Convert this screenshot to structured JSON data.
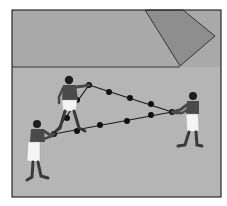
{
  "illustration": {
    "description": "Three figures stretching a knotted rope into a right triangle; pyramid face in background",
    "colors": {
      "sky": "#a9a9a9",
      "ground": "#b4b4b4",
      "pyramid": "#8e8e8e",
      "frame": "#2a2a2a",
      "rope": "#1a1a1a",
      "knot": "#111111",
      "skin": "#4a4a4a",
      "kilt": "#f4f4f4",
      "hair": "#1e1e1e"
    },
    "frame": {
      "x": 12,
      "y": 10,
      "width": 209,
      "height": 187
    },
    "horizon_y": 67,
    "pyramid_points": "145,10 183,10 215,36 180,66",
    "rope_triangle": {
      "corners": [
        [
          89,
          85
        ],
        [
          172,
          112
        ],
        [
          54,
          134
        ]
      ],
      "knots": [
        [
          89,
          85
        ],
        [
          109,
          92
        ],
        [
          130,
          98
        ],
        [
          151,
          104
        ],
        [
          172,
          112
        ],
        [
          151,
          115
        ],
        [
          127,
          121
        ],
        [
          100,
          125
        ],
        [
          77,
          131
        ],
        [
          54,
          134
        ],
        [
          67,
          118
        ],
        [
          77,
          100
        ]
      ]
    },
    "figures": [
      {
        "name": "top-figure",
        "x": 72,
        "y": 78
      },
      {
        "name": "left-figure",
        "x": 36,
        "y": 127
      },
      {
        "name": "right-figure",
        "x": 191,
        "y": 100
      }
    ]
  }
}
